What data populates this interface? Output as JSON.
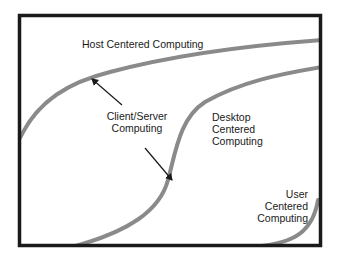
{
  "diagram": {
    "frame_color": "#1a1a1a",
    "curve_color": "#8a8a8a",
    "arrow_color": "#1a1a1a",
    "labels": {
      "host": "Host Centered Computing",
      "client_server_line1": "Client/Server",
      "client_server_line2": "Computing",
      "desktop_line1": "Desktop",
      "desktop_line2": "Centered",
      "desktop_line3": "Computing",
      "user_line1": "User",
      "user_line2": "Centered",
      "user_line3": "Computing"
    },
    "curves": [
      {
        "name": "Host Centered Computing"
      },
      {
        "name": "Desktop Centered Computing"
      },
      {
        "name": "User Centered Computing"
      }
    ],
    "arrow": {
      "name": "Client/Server Computing",
      "type": "double-headed"
    }
  }
}
